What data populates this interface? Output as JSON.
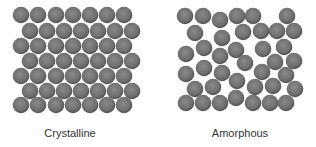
{
  "figure": {
    "colors": {
      "particle_fill": "#6f6f6f",
      "particle_light": "#8a8a8a",
      "particle_edge": "#4f4f4f",
      "label_text": "#333333",
      "background": "#ffffff"
    },
    "particle_radius": 8.3,
    "panels": [
      {
        "label": "Crystalline",
        "arrangement": "ordered hexagonal lattice",
        "rows": 7,
        "per_row": 7,
        "particles": [
          [
            21,
            15
          ],
          [
            38,
            15
          ],
          [
            56,
            15
          ],
          [
            73,
            15
          ],
          [
            90,
            15
          ],
          [
            107,
            15
          ],
          [
            124,
            15
          ],
          [
            30,
            31
          ],
          [
            47,
            31
          ],
          [
            64,
            31
          ],
          [
            81,
            31
          ],
          [
            98,
            31
          ],
          [
            115,
            31
          ],
          [
            132,
            31
          ],
          [
            21,
            46
          ],
          [
            38,
            46
          ],
          [
            56,
            46
          ],
          [
            73,
            46
          ],
          [
            90,
            46
          ],
          [
            107,
            46
          ],
          [
            124,
            46
          ],
          [
            30,
            61
          ],
          [
            47,
            61
          ],
          [
            64,
            61
          ],
          [
            81,
            61
          ],
          [
            98,
            61
          ],
          [
            115,
            61
          ],
          [
            132,
            61
          ],
          [
            21,
            76
          ],
          [
            38,
            76
          ],
          [
            56,
            76
          ],
          [
            73,
            76
          ],
          [
            90,
            76
          ],
          [
            107,
            76
          ],
          [
            124,
            76
          ],
          [
            30,
            91
          ],
          [
            47,
            91
          ],
          [
            64,
            91
          ],
          [
            81,
            91
          ],
          [
            98,
            91
          ],
          [
            115,
            91
          ],
          [
            132,
            91
          ],
          [
            21,
            105
          ],
          [
            38,
            105
          ],
          [
            56,
            105
          ],
          [
            73,
            105
          ],
          [
            90,
            105
          ],
          [
            107,
            105
          ],
          [
            124,
            105
          ]
        ]
      },
      {
        "label": "Amorphous",
        "arrangement": "disordered random packing",
        "particles": [
          [
            185,
            16
          ],
          [
            203,
            16
          ],
          [
            220,
            20
          ],
          [
            237,
            16
          ],
          [
            253,
            16
          ],
          [
            287,
            16
          ],
          [
            195,
            33
          ],
          [
            222,
            38
          ],
          [
            243,
            32
          ],
          [
            261,
            31
          ],
          [
            277,
            31
          ],
          [
            294,
            31
          ],
          [
            186,
            54
          ],
          [
            204,
            48
          ],
          [
            220,
            56
          ],
          [
            236,
            50
          ],
          [
            263,
            49
          ],
          [
            284,
            47
          ],
          [
            245,
            63
          ],
          [
            275,
            62
          ],
          [
            294,
            61
          ],
          [
            186,
            74
          ],
          [
            204,
            68
          ],
          [
            222,
            73
          ],
          [
            262,
            72
          ],
          [
            286,
            75
          ],
          [
            237,
            81
          ],
          [
            255,
            87
          ],
          [
            273,
            86
          ],
          [
            195,
            89
          ],
          [
            213,
            87
          ],
          [
            295,
            89
          ],
          [
            186,
            103
          ],
          [
            203,
            103
          ],
          [
            220,
            103
          ],
          [
            236,
            98
          ],
          [
            253,
            103
          ],
          [
            270,
            103
          ],
          [
            286,
            103
          ]
        ]
      }
    ]
  }
}
